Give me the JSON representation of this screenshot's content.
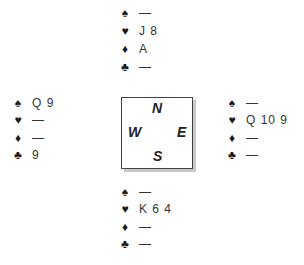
{
  "suits": {
    "spades": "♠",
    "hearts": "♥",
    "diamonds": "♦",
    "clubs": "♣"
  },
  "compass": {
    "north": "N",
    "south": "S",
    "east": "E",
    "west": "W"
  },
  "hands": {
    "north": {
      "spades": "—",
      "hearts": "J 8",
      "diamonds": "A",
      "clubs": "—"
    },
    "west": {
      "spades": "Q 9",
      "hearts": "—",
      "diamonds": "—",
      "clubs": "9"
    },
    "east": {
      "spades": "—",
      "hearts": "Q 10 9",
      "diamonds": "—",
      "clubs": "—"
    },
    "south": {
      "spades": "—",
      "hearts": "K 6 4",
      "diamonds": "—",
      "clubs": "—"
    }
  }
}
